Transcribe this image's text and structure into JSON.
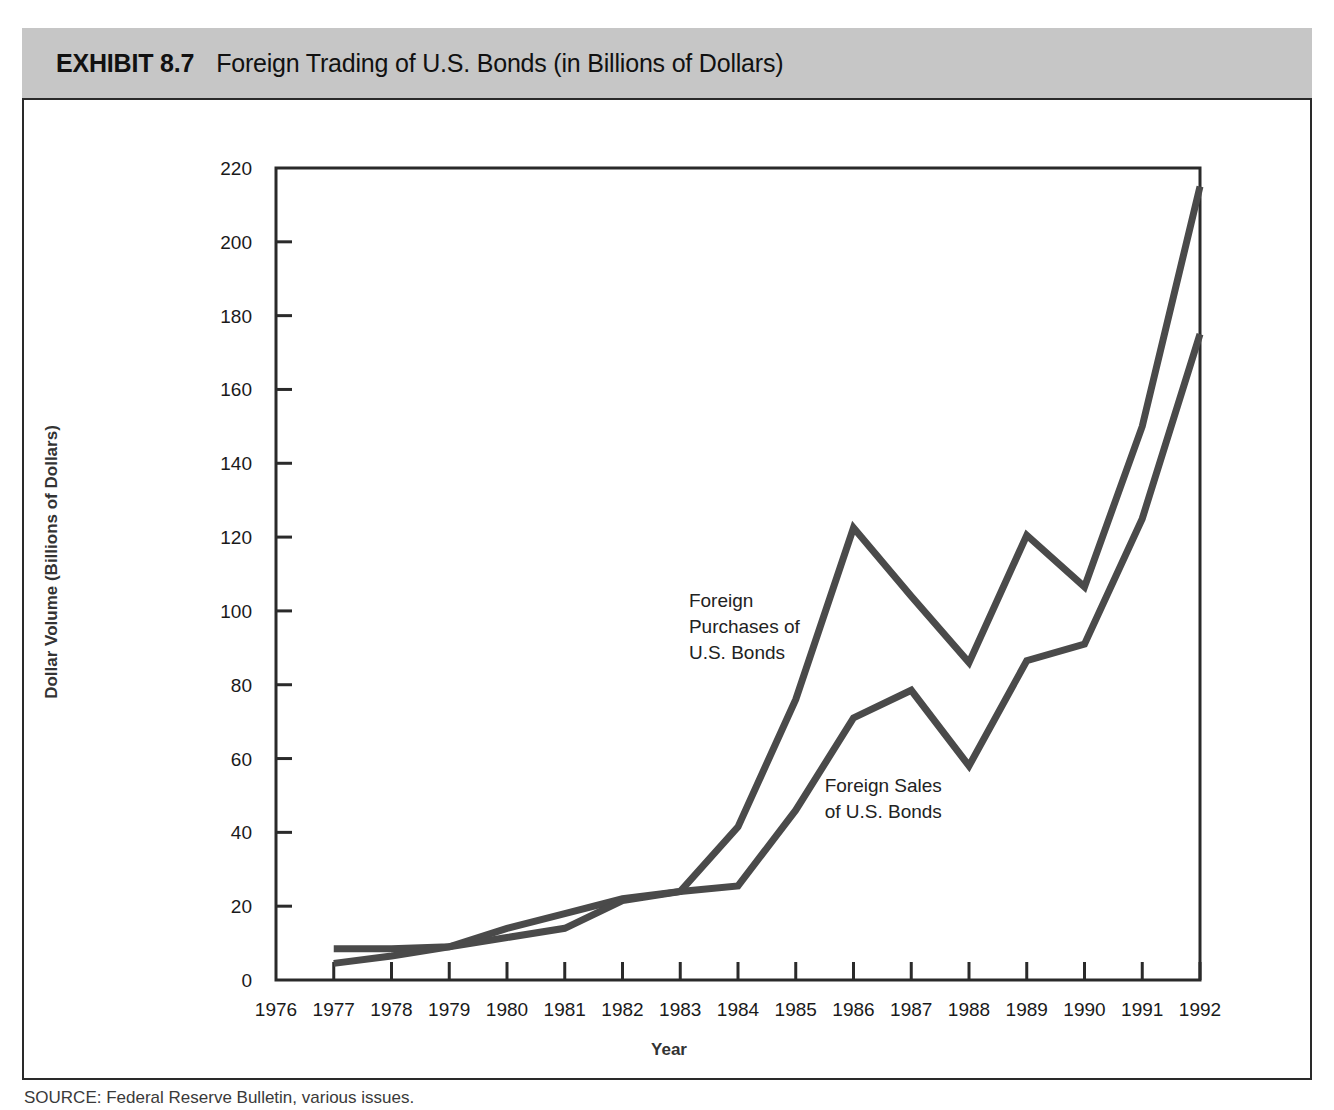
{
  "header": {
    "exhibit_number": "EXHIBIT 8.7",
    "title": "Foreign Trading of U.S. Bonds (in Billions of Dollars)"
  },
  "footer": {
    "source": "SOURCE: Federal Reserve Bulletin, various issues."
  },
  "colors": {
    "header_band": "#c6c6c6",
    "frame": "#2a2a2a",
    "line": "#4a4a4a",
    "text": "#1a1a1a"
  },
  "chart_data": {
    "type": "line",
    "title": "Foreign Trading of U.S. Bonds (in Billions of Dollars)",
    "xlabel": "Year",
    "ylabel": "Dollar Volume (Billions of Dollars)",
    "xlim": [
      1976,
      1992
    ],
    "ylim": [
      0,
      220
    ],
    "grid": false,
    "legend_position": "inline-annotations",
    "x": [
      1976,
      1977,
      1978,
      1979,
      1980,
      1981,
      1982,
      1983,
      1984,
      1985,
      1986,
      1987,
      1988,
      1989,
      1990,
      1991,
      1992
    ],
    "xtick_labels": [
      "1976",
      "1977",
      "1978",
      "1979",
      "1980",
      "1981",
      "1982",
      "1983",
      "1984",
      "1985",
      "1986",
      "1987",
      "1988",
      "1989",
      "1990",
      "1991",
      "1992"
    ],
    "ytick_labels": [
      "0",
      "20",
      "40",
      "60",
      "80",
      "100",
      "120",
      "140",
      "160",
      "180",
      "200",
      "220"
    ],
    "ytick_values": [
      0,
      20,
      40,
      60,
      80,
      100,
      120,
      140,
      160,
      180,
      200,
      220
    ],
    "series": [
      {
        "name": "Foreign Purchases of U.S. Bonds",
        "annotation": "Foreign\nPurchases of\nU.S. Bonds",
        "annotation_lines": [
          "Foreign",
          "Purchases of",
          "U.S. Bonds"
        ],
        "x": [
          1977,
          1978,
          1979,
          1980,
          1981,
          1982,
          1983,
          1984,
          1985,
          1986,
          1987,
          1988,
          1989,
          1990,
          1991,
          1992
        ],
        "values": [
          8.5,
          8.5,
          9.0,
          14.0,
          18.0,
          22.0,
          24.0,
          41.5,
          76.0,
          122.5,
          104.0,
          86.0,
          120.5,
          106.5,
          150.0,
          215.0
        ]
      },
      {
        "name": "Foreign Sales of U.S. Bonds",
        "annotation": "Foreign Sales\nof U.S. Bonds",
        "annotation_lines": [
          "Foreign Sales",
          "of U.S. Bonds"
        ],
        "x": [
          1977,
          1978,
          1979,
          1980,
          1981,
          1982,
          1983,
          1984,
          1985,
          1986,
          1987,
          1988,
          1989,
          1990,
          1991,
          1992
        ],
        "values": [
          4.5,
          6.5,
          9.0,
          11.5,
          14.0,
          21.5,
          24.0,
          25.5,
          46.0,
          71.0,
          78.5,
          58.0,
          86.5,
          91.0,
          125.0,
          175.0
        ]
      }
    ]
  }
}
